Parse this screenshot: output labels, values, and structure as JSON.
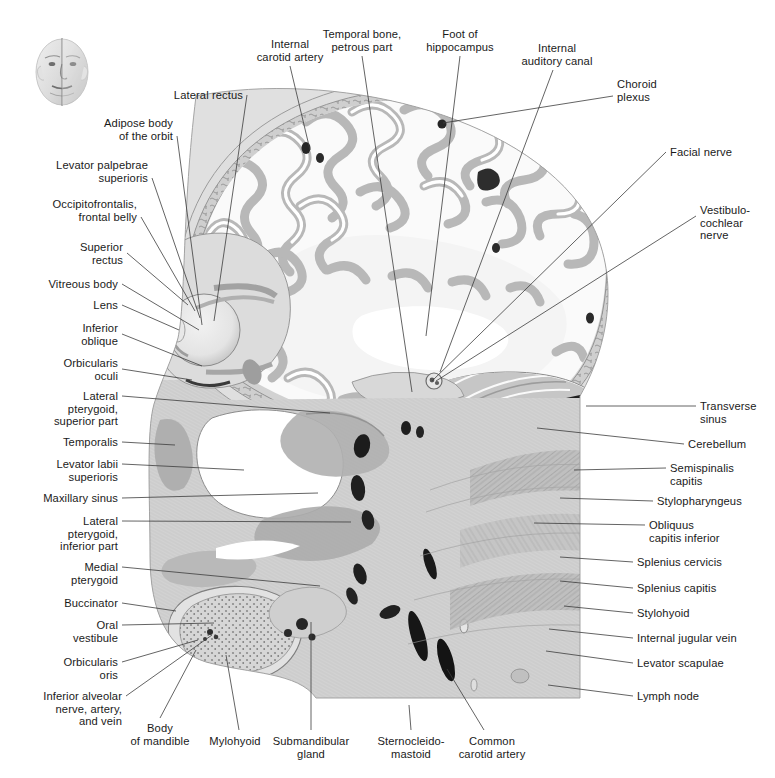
{
  "figure": {
    "type": "anatomical-cross-section",
    "orientation_thumbnail": "head-orientation-thumbnail",
    "background_color": "#ffffff",
    "text_color": "#1a1a1a",
    "leader_line_color": "#3c3c3c"
  },
  "labels": {
    "top": [
      {
        "id": "internal-carotid-artery",
        "text": "Internal\ncarotid artery",
        "align": "c",
        "x": 290,
        "y": 38,
        "line": [
          [
            290,
            66
          ],
          [
            310,
            150
          ]
        ]
      },
      {
        "id": "temporal-bone-petrous-part",
        "text": "Temporal bone,\npetrous part",
        "align": "c",
        "x": 362,
        "y": 28,
        "line": [
          [
            362,
            56
          ],
          [
            412,
            392
          ]
        ]
      },
      {
        "id": "foot-of-hippocampus",
        "text": "Foot of\nhippocampus",
        "align": "c",
        "x": 460,
        "y": 28,
        "line": [
          [
            460,
            56
          ],
          [
            426,
            336
          ]
        ]
      },
      {
        "id": "internal-auditory-canal",
        "text": "Internal\nauditory canal",
        "align": "c",
        "x": 557,
        "y": 42,
        "line": [
          [
            553,
            70
          ],
          [
            440,
            372
          ]
        ]
      }
    ],
    "left": [
      {
        "id": "lateral-rectus",
        "text": "Lateral rectus",
        "align": "r",
        "x": 243,
        "y": 89,
        "line": [
          [
            247,
            95
          ],
          [
            214,
            321
          ]
        ]
      },
      {
        "id": "adipose-body-of-the-orbit",
        "text": "Adipose body\nof the orbit",
        "align": "r",
        "x": 173,
        "y": 117,
        "line": [
          [
            177,
            136
          ],
          [
            202,
            325
          ]
        ]
      },
      {
        "id": "levator-palpebrae-superioris",
        "text": "Levator palpebrae\nsuperioris",
        "align": "r",
        "x": 148,
        "y": 159,
        "line": [
          [
            152,
            178
          ],
          [
            200,
            318
          ]
        ]
      },
      {
        "id": "occipitofrontalis-frontal-belly",
        "text": "Occipitofrontalis,\nfrontal belly",
        "align": "r",
        "x": 137,
        "y": 198,
        "line": [
          [
            141,
            217
          ],
          [
            195,
            311
          ]
        ]
      },
      {
        "id": "superior-rectus",
        "text": "Superior\nrectus",
        "align": "r",
        "x": 123,
        "y": 241,
        "line": [
          [
            127,
            253
          ],
          [
            188,
            305
          ]
        ]
      },
      {
        "id": "vitreous-body",
        "text": "Vitreous body",
        "align": "r",
        "x": 118,
        "y": 278,
        "line": [
          [
            122,
            284
          ],
          [
            199,
            330
          ]
        ]
      },
      {
        "id": "lens",
        "text": "Lens",
        "align": "r",
        "x": 118,
        "y": 299,
        "line": [
          [
            122,
            305
          ],
          [
            179,
            330
          ]
        ]
      },
      {
        "id": "inferior-oblique",
        "text": "Inferior\noblique",
        "align": "r",
        "x": 118,
        "y": 322,
        "line": [
          [
            122,
            334
          ],
          [
            202,
            366
          ]
        ]
      },
      {
        "id": "orbicularis-oculi",
        "text": "Orbicularis\noculi",
        "align": "r",
        "x": 118,
        "y": 357,
        "line": [
          [
            122,
            369
          ],
          [
            192,
            380
          ]
        ]
      },
      {
        "id": "lateral-pterygoid-superior-part",
        "text": "Lateral\npterygoid,\nsuperior part",
        "align": "r",
        "x": 118,
        "y": 390,
        "line": [
          [
            122,
            396
          ],
          [
            330,
            413
          ]
        ]
      },
      {
        "id": "temporalis",
        "text": "Temporalis",
        "align": "r",
        "x": 118,
        "y": 436,
        "line": [
          [
            122,
            442
          ],
          [
            175,
            445
          ]
        ]
      },
      {
        "id": "levator-labii-superioris",
        "text": "Levator labii\nsuperioris",
        "align": "r",
        "x": 118,
        "y": 458,
        "line": [
          [
            122,
            464
          ],
          [
            244,
            470
          ]
        ]
      },
      {
        "id": "maxillary-sinus",
        "text": "Maxillary sinus",
        "align": "r",
        "x": 118,
        "y": 492,
        "line": [
          [
            122,
            498
          ],
          [
            318,
            493
          ]
        ]
      },
      {
        "id": "lateral-pterygoid-inferior-part",
        "text": "Lateral\npterygoid,\ninferior part",
        "align": "r",
        "x": 118,
        "y": 515,
        "line": [
          [
            122,
            521
          ],
          [
            351,
            522
          ]
        ]
      },
      {
        "id": "medial-pterygoid",
        "text": "Medial\npterygoid",
        "align": "r",
        "x": 118,
        "y": 561,
        "line": [
          [
            122,
            567
          ],
          [
            320,
            586
          ]
        ]
      },
      {
        "id": "buccinator",
        "text": "Buccinator",
        "align": "r",
        "x": 118,
        "y": 597,
        "line": [
          [
            122,
            603
          ],
          [
            176,
            611
          ]
        ]
      },
      {
        "id": "oral-vestibule",
        "text": "Oral\nvestibule",
        "align": "r",
        "x": 118,
        "y": 619,
        "line": [
          [
            122,
            625
          ],
          [
            214,
            623
          ]
        ]
      },
      {
        "id": "orbicularis-oris",
        "text": "Orbicularis\noris",
        "align": "r",
        "x": 118,
        "y": 656,
        "line": [
          [
            122,
            662
          ],
          [
            198,
            640
          ]
        ]
      },
      {
        "id": "inferior-alveolar-nerve-artery-and-vein",
        "text": "Inferior alveolar\nnerve, artery,\nand vein",
        "align": "r",
        "x": 122,
        "y": 690,
        "line": [
          [
            126,
            696
          ],
          [
            212,
            635
          ]
        ]
      }
    ],
    "bottom": [
      {
        "id": "body-of-mandible",
        "text": "Body\nof mandible",
        "align": "c",
        "x": 160,
        "y": 722,
        "line": [
          [
            160,
            718
          ],
          [
            196,
            650
          ]
        ]
      },
      {
        "id": "mylohyoid",
        "text": "Mylohyoid",
        "align": "c",
        "x": 235,
        "y": 735,
        "line": [
          [
            239,
            730
          ],
          [
            226,
            655
          ]
        ]
      },
      {
        "id": "submandibular-gland",
        "text": "Submandibular\ngland",
        "align": "c",
        "x": 311,
        "y": 735,
        "line": [
          [
            311,
            730
          ],
          [
            311,
            622
          ]
        ]
      },
      {
        "id": "sternocleidomastoid",
        "text": "Sternocleido-\nmastoid",
        "align": "c",
        "x": 411,
        "y": 735,
        "line": [
          [
            411,
            730
          ],
          [
            409,
            705
          ]
        ]
      },
      {
        "id": "common-carotid-artery",
        "text": "Common\ncarotid artery",
        "align": "c",
        "x": 492,
        "y": 735,
        "line": [
          [
            484,
            730
          ],
          [
            447,
            669
          ]
        ]
      }
    ],
    "right": [
      {
        "id": "choroid-plexus",
        "text": "Choroid\nplexus",
        "align": "l",
        "x": 617,
        "y": 78,
        "line": [
          [
            613,
            96
          ],
          [
            443,
            123
          ]
        ]
      },
      {
        "id": "facial-nerve",
        "text": "Facial nerve",
        "align": "l",
        "x": 670,
        "y": 146,
        "line": [
          [
            666,
            152
          ],
          [
            432,
            381
          ]
        ]
      },
      {
        "id": "vestibulocochlear-nerve",
        "text": "Vestibulo-\ncochlear\nnerve",
        "align": "l",
        "x": 700,
        "y": 204,
        "line": [
          [
            696,
            216
          ],
          [
            436,
            381
          ]
        ]
      },
      {
        "id": "transverse-sinus",
        "text": "Transverse\nsinus",
        "align": "l",
        "x": 700,
        "y": 400,
        "line": [
          [
            696,
            406
          ],
          [
            586,
            406
          ]
        ]
      },
      {
        "id": "cerebellum",
        "text": "Cerebellum",
        "align": "l",
        "x": 688,
        "y": 438,
        "line": [
          [
            684,
            444
          ],
          [
            537,
            428
          ]
        ]
      },
      {
        "id": "semispinalis-capitis",
        "text": "Semispinalis\ncapitis",
        "align": "l",
        "x": 670,
        "y": 462,
        "line": [
          [
            666,
            468
          ],
          [
            574,
            470
          ]
        ]
      },
      {
        "id": "stylopharyngeus",
        "text": "Stylopharyngeus",
        "align": "l",
        "x": 657,
        "y": 495,
        "line": [
          [
            653,
            501
          ],
          [
            560,
            498
          ]
        ]
      },
      {
        "id": "obliquus-capitis-inferior",
        "text": "Obliquus\ncapitis inferior",
        "align": "l",
        "x": 649,
        "y": 519,
        "line": [
          [
            645,
            525
          ],
          [
            534,
            523
          ]
        ]
      },
      {
        "id": "splenius-cervicis",
        "text": "Splenius cervicis",
        "align": "l",
        "x": 637,
        "y": 556,
        "line": [
          [
            633,
            562
          ],
          [
            560,
            557
          ]
        ]
      },
      {
        "id": "splenius-capitis",
        "text": "Splenius capitis",
        "align": "l",
        "x": 637,
        "y": 582,
        "line": [
          [
            633,
            588
          ],
          [
            560,
            581
          ]
        ]
      },
      {
        "id": "stylohyoid",
        "text": "Stylohyoid",
        "align": "l",
        "x": 637,
        "y": 607,
        "line": [
          [
            633,
            613
          ],
          [
            564,
            606
          ]
        ]
      },
      {
        "id": "internal-jugular-vein",
        "text": "Internal jugular vein",
        "align": "l",
        "x": 637,
        "y": 632,
        "line": [
          [
            633,
            638
          ],
          [
            549,
            629
          ]
        ]
      },
      {
        "id": "levator-scapulae",
        "text": "Levator scapulae",
        "align": "l",
        "x": 637,
        "y": 657,
        "line": [
          [
            633,
            663
          ],
          [
            546,
            651
          ]
        ]
      },
      {
        "id": "lymph-node",
        "text": "Lymph node",
        "align": "l",
        "x": 637,
        "y": 690,
        "line": [
          [
            633,
            696
          ],
          [
            548,
            685
          ]
        ]
      }
    ]
  }
}
